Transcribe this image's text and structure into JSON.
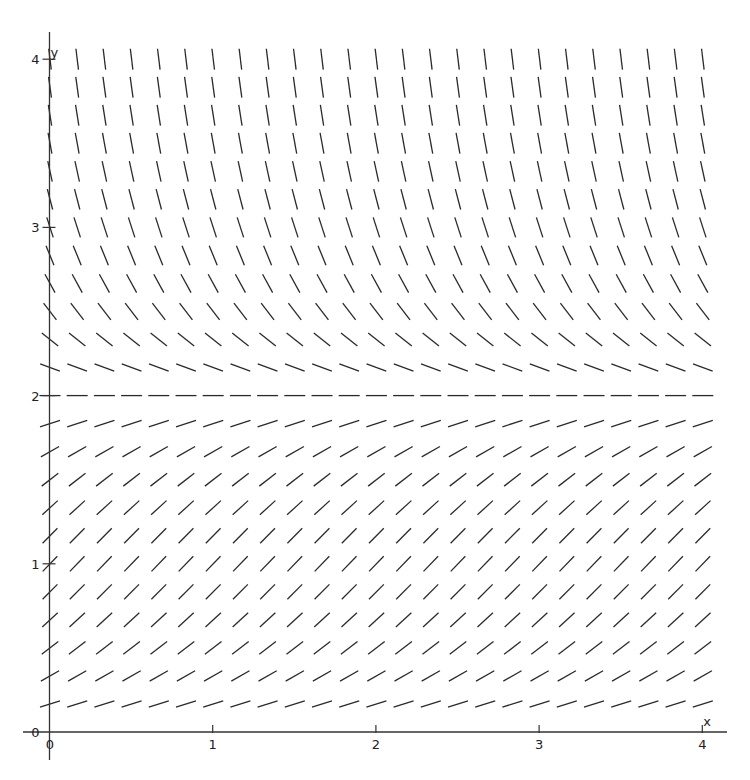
{
  "chart_data": {
    "type": "slope_field",
    "title": "",
    "equation": "dy/dx = y(2 - y)",
    "xlabel": "x",
    "ylabel": "y",
    "xlim": [
      0,
      4
    ],
    "ylim": [
      0,
      4
    ],
    "x_ticks": [
      {
        "value": 0,
        "label": "0"
      },
      {
        "value": 1,
        "label": "1"
      },
      {
        "value": 2,
        "label": "2"
      },
      {
        "value": 3,
        "label": "3"
      },
      {
        "value": 4,
        "label": "4"
      }
    ],
    "y_ticks": [
      {
        "value": 0,
        "label": "0"
      },
      {
        "value": 1,
        "label": "1"
      },
      {
        "value": 2,
        "label": "2"
      },
      {
        "value": 3,
        "label": "3"
      },
      {
        "value": 4,
        "label": "4"
      }
    ],
    "grid": false,
    "legend": null,
    "field": {
      "x_start": 0,
      "x_end": 4,
      "y_start": 0.16667,
      "y_end": 4,
      "step": 0.16667,
      "slope_depends_on": "y only",
      "equilibrium_y": 2,
      "segment_length_px": 21,
      "sample_slopes": [
        {
          "y": 0.1667,
          "slope": 0.31
        },
        {
          "y": 0.5,
          "slope": 0.75
        },
        {
          "y": 1.0,
          "slope": 1.0
        },
        {
          "y": 1.5,
          "slope": 0.75
        },
        {
          "y": 1.8333,
          "slope": 0.31
        },
        {
          "y": 2.0,
          "slope": 0.0
        },
        {
          "y": 2.1667,
          "slope": -0.36
        },
        {
          "y": 2.5,
          "slope": -1.25
        },
        {
          "y": 3.0,
          "slope": -3.0
        },
        {
          "y": 3.5,
          "slope": -5.25
        },
        {
          "y": 4.0,
          "slope": -8.0
        }
      ]
    },
    "pixel_map": {
      "x0_px": 49.5,
      "x_unit_px": 163.2,
      "y0_px": 732,
      "y_unit_px": 168.2,
      "x_axis_from_px": 23,
      "x_axis_to_px": 727,
      "y_axis_from_px": 32,
      "y_axis_to_px": 760
    },
    "colors": {
      "background": "#ffffff",
      "ink": "#2a2a2a"
    }
  }
}
